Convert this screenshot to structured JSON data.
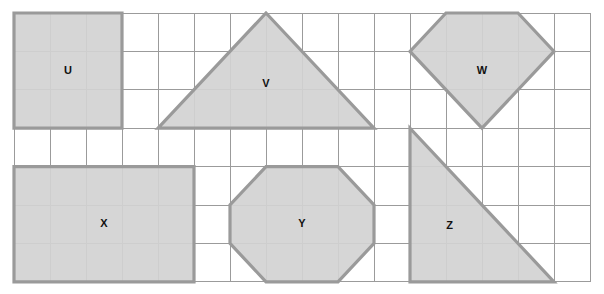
{
  "worksheet": {
    "title": "Geometric shapes on a square grid",
    "background_color": "#ffffff"
  },
  "grid": {
    "columns": 16,
    "rows": 7,
    "origin_x": 14,
    "origin_y": 13,
    "cell_width": 36,
    "cell_height": 38.4,
    "line_color": "#9b9b9b",
    "line_width": 1
  },
  "style": {
    "shape_fill": "#d2d2d2",
    "shape_stroke": "#9a9a9a",
    "shape_stroke_width": 3.2,
    "label_color": "#111111",
    "label_font_size": 11
  },
  "shapes": [
    {
      "label": "U",
      "type": "square",
      "description": "3 by 3 square",
      "grid_points": [
        [
          0,
          0
        ],
        [
          3,
          0
        ],
        [
          3,
          3
        ],
        [
          0,
          3
        ]
      ],
      "label_cell": [
        1.5,
        1.5
      ],
      "width_cells": 3,
      "height_cells": 3
    },
    {
      "label": "V",
      "type": "triangle",
      "description": "isosceles triangle, base 6 cells, height 3 cells",
      "grid_points": [
        [
          7,
          0
        ],
        [
          10,
          3
        ],
        [
          4,
          3
        ]
      ],
      "label_cell": [
        7,
        1.85
      ],
      "width_cells": 6,
      "height_cells": 3
    },
    {
      "label": "W",
      "type": "pentagon",
      "description": "gem shape: flat top 2 cells wide, flared sides, point at bottom",
      "grid_points": [
        [
          12,
          0
        ],
        [
          14,
          0
        ],
        [
          15,
          1
        ],
        [
          13,
          3
        ],
        [
          11,
          1
        ]
      ],
      "label_cell": [
        13,
        1.5
      ],
      "width_cells": 4,
      "height_cells": 3
    },
    {
      "label": "X",
      "type": "rectangle",
      "description": "5 by 3 rectangle",
      "grid_points": [
        [
          0,
          4
        ],
        [
          5,
          4
        ],
        [
          5,
          7
        ],
        [
          0,
          7
        ]
      ],
      "label_cell": [
        2.5,
        5.5
      ],
      "width_cells": 5,
      "height_cells": 3
    },
    {
      "label": "Y",
      "type": "octagon",
      "description": "octagon, 4 cells wide by 3 cells tall with cut corners",
      "grid_points": [
        [
          7,
          4
        ],
        [
          9,
          4
        ],
        [
          10,
          5
        ],
        [
          10,
          6
        ],
        [
          9,
          7
        ],
        [
          7,
          7
        ],
        [
          6,
          6
        ],
        [
          6,
          5
        ]
      ],
      "label_cell": [
        8,
        5.5
      ],
      "width_cells": 4,
      "height_cells": 3
    },
    {
      "label": "Z",
      "type": "right-triangle",
      "description": "right triangle, legs 4 cells by 4 cells",
      "grid_points": [
        [
          11,
          3
        ],
        [
          11,
          7
        ],
        [
          15,
          7
        ]
      ],
      "label_cell": [
        12.1,
        5.55
      ],
      "width_cells": 4,
      "height_cells": 4
    }
  ]
}
